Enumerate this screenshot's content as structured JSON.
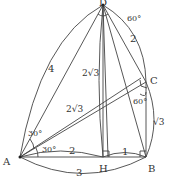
{
  "points": {
    "D": {
      "label": "D",
      "x": 103,
      "y": 5
    },
    "A": {
      "label": "A",
      "x": 20,
      "y": 157
    },
    "H": {
      "label": "H",
      "x": 103,
      "y": 157
    },
    "B": {
      "label": "B",
      "x": 146,
      "y": 157
    },
    "C": {
      "label": "C",
      "x": 146,
      "y": 82
    }
  },
  "labels": {
    "DA": "4",
    "DC": "2",
    "DH": "2√3",
    "AC": "2√3",
    "CB": "√3",
    "AH": "2",
    "HB": "1",
    "AB": "3",
    "angle_D": "60°",
    "angle_C": "60°",
    "angle_A_upper": "30°",
    "angle_A_lower": "30°"
  }
}
